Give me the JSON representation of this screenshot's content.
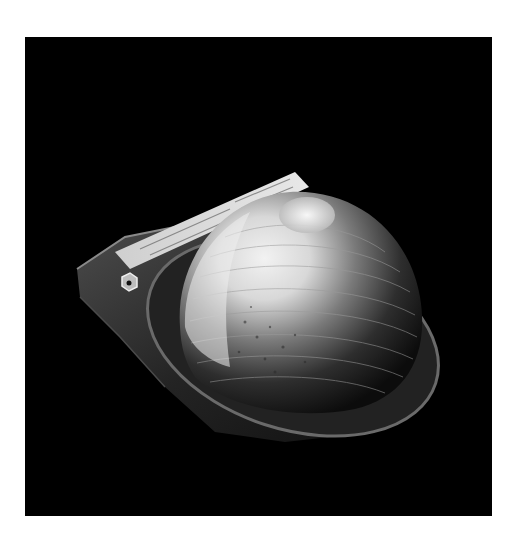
{
  "image": {
    "description": "Grayscale photograph of a terraced dome-shaped specimen on a transparent plate with a small label strip, against a black background",
    "background_color": "#000000",
    "frame_color": "#ffffff",
    "label_strip": {
      "text_legible": false
    }
  }
}
